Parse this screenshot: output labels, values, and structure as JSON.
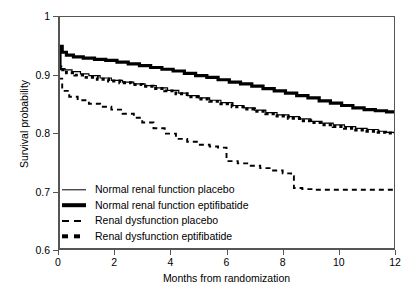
{
  "chart_data": {
    "type": "line",
    "title": "",
    "xlabel": "Months from randomization",
    "ylabel": "Survival probability",
    "xlim": [
      0,
      12
    ],
    "ylim": [
      0.6,
      1
    ],
    "xticks": [
      0,
      2,
      4,
      6,
      8,
      10,
      12
    ],
    "yticks": [
      0.6,
      0.7,
      0.8,
      0.9,
      1
    ],
    "xtick_labels": [
      "0",
      "2",
      "4",
      "6",
      "8",
      "10",
      "12"
    ],
    "ytick_labels": [
      "0.6",
      "0.7",
      "0.8",
      "0.9",
      "1"
    ],
    "grid": false,
    "legend_position": "lower-left-inside",
    "series": [
      {
        "name": "Normal renal function placebo",
        "style": "solid-thin",
        "x": [
          0,
          0.1,
          0.25,
          0.5,
          0.8,
          1.1,
          1.5,
          1.9,
          2.3,
          2.7,
          3.1,
          3.5,
          3.9,
          4.3,
          4.6,
          5.0,
          5.4,
          5.8,
          6.2,
          6.6,
          7.0,
          7.4,
          7.8,
          8.2,
          8.6,
          9.0,
          9.4,
          9.8,
          10.2,
          10.6,
          11.0,
          11.4,
          11.7,
          12.0
        ],
        "y": [
          0.912,
          0.91,
          0.908,
          0.905,
          0.901,
          0.898,
          0.894,
          0.89,
          0.887,
          0.884,
          0.881,
          0.877,
          0.873,
          0.868,
          0.864,
          0.86,
          0.856,
          0.852,
          0.847,
          0.843,
          0.839,
          0.835,
          0.831,
          0.828,
          0.824,
          0.82,
          0.817,
          0.814,
          0.811,
          0.808,
          0.806,
          0.803,
          0.801,
          0.8
        ]
      },
      {
        "name": "Normal renal function eptifibatide",
        "style": "solid-thick",
        "x": [
          0,
          0.07,
          0.15,
          0.3,
          0.55,
          0.9,
          1.3,
          1.7,
          2.1,
          2.5,
          2.9,
          3.3,
          3.7,
          4.1,
          4.5,
          4.9,
          5.3,
          5.7,
          6.1,
          6.5,
          6.9,
          7.3,
          7.7,
          8.1,
          8.5,
          8.9,
          9.3,
          9.7,
          10.1,
          10.5,
          10.9,
          11.3,
          11.7,
          12.0
        ],
        "y": [
          0.91,
          0.948,
          0.938,
          0.933,
          0.93,
          0.928,
          0.926,
          0.924,
          0.921,
          0.918,
          0.915,
          0.912,
          0.909,
          0.906,
          0.902,
          0.898,
          0.895,
          0.891,
          0.887,
          0.884,
          0.88,
          0.876,
          0.872,
          0.868,
          0.864,
          0.86,
          0.855,
          0.851,
          0.847,
          0.843,
          0.84,
          0.838,
          0.836,
          0.835
        ]
      },
      {
        "name": "Renal dysfunction placebo",
        "style": "dashed-long",
        "x": [
          0,
          0.15,
          0.4,
          0.7,
          1.1,
          1.5,
          1.9,
          2.3,
          2.7,
          3.0,
          3.4,
          3.8,
          4.2,
          4.6,
          5.0,
          5.4,
          5.7,
          6.0,
          6.0,
          6.4,
          6.8,
          7.2,
          7.6,
          8.0,
          8.3,
          8.4,
          8.7,
          9.1,
          9.6,
          10.2,
          10.8,
          11.4,
          12.0
        ],
        "y": [
          0.893,
          0.872,
          0.862,
          0.856,
          0.85,
          0.845,
          0.84,
          0.833,
          0.826,
          0.818,
          0.808,
          0.799,
          0.79,
          0.785,
          0.78,
          0.777,
          0.775,
          0.774,
          0.752,
          0.748,
          0.744,
          0.74,
          0.736,
          0.731,
          0.726,
          0.706,
          0.704,
          0.703,
          0.703,
          0.703,
          0.703,
          0.703,
          0.703
        ]
      },
      {
        "name": "Renal dysfunction eptifibatide",
        "style": "dotted-bold",
        "x": [
          0,
          0.1,
          0.3,
          0.6,
          1.0,
          1.4,
          1.8,
          2.2,
          2.6,
          3.0,
          3.4,
          3.8,
          4.2,
          4.6,
          5.0,
          5.4,
          5.8,
          6.2,
          6.6,
          7.0,
          7.4,
          7.8,
          8.2,
          8.6,
          9.0,
          9.4,
          9.8,
          10.2,
          10.6,
          11.0,
          11.4,
          11.7,
          12.0
        ],
        "y": [
          0.913,
          0.908,
          0.903,
          0.899,
          0.895,
          0.892,
          0.889,
          0.886,
          0.883,
          0.88,
          0.876,
          0.872,
          0.867,
          0.862,
          0.858,
          0.854,
          0.85,
          0.845,
          0.841,
          0.837,
          0.833,
          0.829,
          0.825,
          0.821,
          0.818,
          0.814,
          0.811,
          0.808,
          0.805,
          0.803,
          0.801,
          0.8,
          0.799
        ]
      }
    ]
  },
  "legend": {
    "items": [
      {
        "label": "Normal renal function placebo"
      },
      {
        "label": "Normal renal function eptifibatide"
      },
      {
        "label": "Renal dysfunction placebo"
      },
      {
        "label": "Renal dysfunction eptifibatide"
      }
    ]
  },
  "colors": {
    "line": "#000000",
    "axis": "#555555",
    "background": "#ffffff"
  }
}
